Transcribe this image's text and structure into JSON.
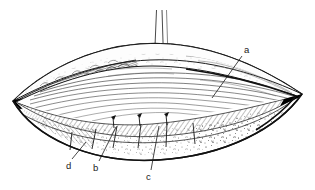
{
  "figure": {
    "type": "line-drawing",
    "background_color": "#ffffff",
    "ink_color": "#1a1a1a",
    "shading_color": "#555555",
    "fill_color": "#000000",
    "width": 315,
    "height": 190,
    "labels": [
      {
        "id": "a",
        "text": "a",
        "x": 246,
        "y": 52,
        "leader_from": [
          241,
          55
        ],
        "leader_to": [
          212,
          98
        ]
      },
      {
        "id": "b",
        "text": "b",
        "x": 95,
        "y": 168,
        "leader_from": [
          99,
          161
        ],
        "leader_to": [
          116,
          128
        ]
      },
      {
        "id": "c",
        "text": "c",
        "x": 148,
        "y": 178,
        "leader_from": [
          150,
          171
        ],
        "leader_to": [
          158,
          127
        ]
      },
      {
        "id": "d",
        "text": "d",
        "x": 68,
        "y": 166,
        "leader_from": [
          72,
          159
        ],
        "leader_to": [
          85,
          143
        ]
      }
    ],
    "instrument": {
      "name": "probe",
      "shaft_left_x": 156,
      "shaft_right_x": 166,
      "top_y": 10,
      "tip_y": 64
    },
    "pins": [
      {
        "x": 113,
        "y": 116
      },
      {
        "x": 139,
        "y": 114
      },
      {
        "x": 166,
        "y": 113
      }
    ],
    "dividers": [
      {
        "x1": 72,
        "y1": 133,
        "x2": 70,
        "y2": 150
      },
      {
        "x1": 96,
        "y1": 128,
        "x2": 92,
        "y2": 148
      },
      {
        "x1": 116,
        "y1": 125,
        "x2": 113,
        "y2": 147
      },
      {
        "x1": 140,
        "y1": 123,
        "x2": 138,
        "y2": 147
      },
      {
        "x1": 166,
        "y1": 122,
        "x2": 166,
        "y2": 146
      },
      {
        "x1": 192,
        "y1": 122,
        "x2": 194,
        "y2": 144
      }
    ]
  }
}
